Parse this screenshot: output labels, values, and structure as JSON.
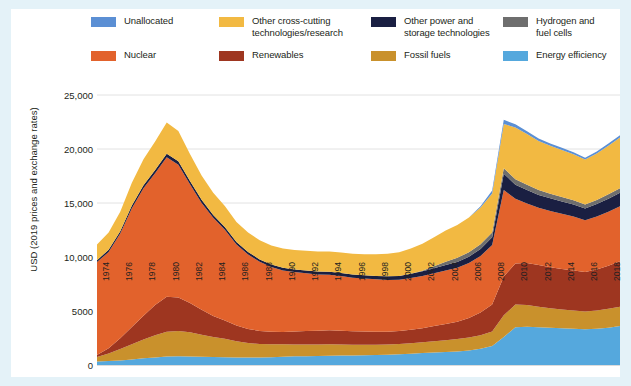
{
  "legend": {
    "items": [
      {
        "label": "Unallocated",
        "color": "#5b8fd4",
        "col": 0,
        "row": 0
      },
      {
        "label": "Other cross-cutting\ntechnologies/research",
        "color": "#f2b942",
        "col": 1,
        "row": 0
      },
      {
        "label": "Other power and\nstorage technologies",
        "color": "#1a1f42",
        "col": 2,
        "row": 0
      },
      {
        "label": "Hydrogen and\nfuel cells",
        "color": "#6e6e6e",
        "col": 3,
        "row": 0
      },
      {
        "label": "Nuclear",
        "color": "#e2622c",
        "col": 0,
        "row": 1
      },
      {
        "label": "Renewables",
        "color": "#9e3620",
        "col": 1,
        "row": 1
      },
      {
        "label": "Fossil fuels",
        "color": "#c9912c",
        "col": 2,
        "row": 1
      },
      {
        "label": "Energy efficiency",
        "color": "#55a8dd",
        "col": 3,
        "row": 1
      }
    ]
  },
  "chart_data": {
    "type": "area",
    "stacked": true,
    "title": "",
    "xlabel": "",
    "ylabel": "USD (2019 prices and exchange rates)",
    "ylim": [
      0,
      25000
    ],
    "yticks": [
      0,
      5000,
      10000,
      15000,
      20000,
      25000
    ],
    "ytick_labels": [
      "0",
      "5000",
      "10,000",
      "15,000",
      "20,000",
      "25,000"
    ],
    "grid": true,
    "legend_position": "top",
    "x": [
      1974,
      1975,
      1976,
      1977,
      1978,
      1979,
      1980,
      1981,
      1982,
      1983,
      1984,
      1985,
      1986,
      1987,
      1988,
      1989,
      1990,
      1991,
      1992,
      1993,
      1994,
      1995,
      1996,
      1997,
      1998,
      1999,
      2000,
      2001,
      2002,
      2003,
      2004,
      2005,
      2006,
      2007,
      2008,
      2009,
      2010,
      2011,
      2012,
      2013,
      2014,
      2015,
      2016,
      2017,
      2018,
      2019
    ],
    "xtick_labels": [
      "1974",
      "1976",
      "1978",
      "1980",
      "1982",
      "1984",
      "1986",
      "1988",
      "1990",
      "1992",
      "1994",
      "1996",
      "1998",
      "2000",
      "2002",
      "2004",
      "2006",
      "2008",
      "2010",
      "2012",
      "2014",
      "2016",
      "2018"
    ],
    "series": [
      {
        "name": "Energy efficiency",
        "color": "#55a8dd",
        "values": [
          330,
          360,
          420,
          520,
          620,
          700,
          780,
          800,
          790,
          760,
          740,
          720,
          700,
          690,
          700,
          720,
          760,
          800,
          820,
          840,
          860,
          870,
          880,
          900,
          920,
          950,
          1000,
          1050,
          1100,
          1150,
          1200,
          1250,
          1350,
          1500,
          1750,
          2600,
          3500,
          3550,
          3500,
          3450,
          3400,
          3350,
          3300,
          3350,
          3450,
          3600
        ]
      },
      {
        "name": "Fossil fuels",
        "color": "#c9912c",
        "values": [
          420,
          700,
          1050,
          1400,
          1750,
          2050,
          2300,
          2350,
          2250,
          2050,
          1850,
          1700,
          1500,
          1350,
          1250,
          1200,
          1150,
          1100,
          1080,
          1060,
          1050,
          1030,
          1000,
          980,
          960,
          950,
          940,
          960,
          1000,
          1050,
          1100,
          1150,
          1200,
          1250,
          1350,
          2000,
          2100,
          2000,
          1900,
          1800,
          1750,
          1700,
          1650,
          1700,
          1750,
          1800
        ]
      },
      {
        "name": "Renewables",
        "color": "#9e3620",
        "values": [
          180,
          500,
          1000,
          1600,
          2200,
          2800,
          3250,
          3100,
          2700,
          2300,
          1950,
          1700,
          1450,
          1300,
          1200,
          1150,
          1150,
          1200,
          1250,
          1280,
          1300,
          1280,
          1250,
          1220,
          1200,
          1180,
          1200,
          1250,
          1300,
          1400,
          1500,
          1600,
          1800,
          2100,
          2500,
          3600,
          3800,
          3900,
          3850,
          3800,
          3750,
          3700,
          3650,
          3800,
          4000,
          4200
        ]
      },
      {
        "name": "Nuclear",
        "color": "#e2622c",
        "values": [
          8600,
          8900,
          9700,
          11000,
          11800,
          12200,
          12900,
          12300,
          11000,
          9900,
          9100,
          8400,
          7500,
          6900,
          6400,
          6000,
          5700,
          5500,
          5350,
          5200,
          5150,
          5050,
          4950,
          4900,
          4850,
          4800,
          4750,
          4800,
          4850,
          4900,
          4950,
          5000,
          5100,
          5250,
          5500,
          8000,
          6000,
          5500,
          5300,
          5200,
          5100,
          5000,
          4800,
          4900,
          5000,
          5100
        ]
      },
      {
        "name": "Other power and storage technologies",
        "color": "#1a1f42",
        "values": [
          180,
          200,
          220,
          250,
          280,
          300,
          320,
          320,
          300,
          280,
          260,
          250,
          240,
          230,
          230,
          230,
          240,
          250,
          260,
          270,
          280,
          290,
          300,
          310,
          320,
          330,
          350,
          380,
          420,
          460,
          500,
          540,
          580,
          640,
          720,
          1500,
          1300,
          1250,
          1200,
          1180,
          1150,
          1120,
          1100,
          1150,
          1200,
          1250
        ]
      },
      {
        "name": "Hydrogen and fuel cells",
        "color": "#6e6e6e",
        "values": [
          0,
          0,
          0,
          0,
          0,
          0,
          0,
          0,
          0,
          0,
          0,
          0,
          0,
          0,
          0,
          0,
          0,
          0,
          0,
          0,
          0,
          0,
          0,
          0,
          0,
          0,
          0,
          0,
          60,
          180,
          300,
          380,
          420,
          440,
          450,
          520,
          500,
          480,
          450,
          430,
          410,
          390,
          370,
          380,
          400,
          410
        ]
      },
      {
        "name": "Other cross-cutting technologies/research",
        "color": "#f2b942",
        "values": [
          1450,
          1600,
          1800,
          2100,
          2400,
          2650,
          2900,
          2800,
          2500,
          2250,
          2050,
          1950,
          1850,
          1800,
          1780,
          1760,
          1780,
          1800,
          1820,
          1850,
          1880,
          1900,
          1920,
          1950,
          2000,
          2080,
          2200,
          2350,
          2500,
          2700,
          2900,
          3050,
          3200,
          3400,
          3600,
          4100,
          4800,
          4700,
          4550,
          4450,
          4350,
          4250,
          4150,
          4300,
          4500,
          4700
        ]
      },
      {
        "name": "Unallocated",
        "color": "#5b8fd4",
        "values": [
          0,
          0,
          0,
          0,
          0,
          0,
          0,
          0,
          0,
          0,
          0,
          0,
          0,
          0,
          0,
          0,
          0,
          0,
          0,
          0,
          0,
          0,
          0,
          0,
          0,
          0,
          0,
          0,
          0,
          0,
          0,
          0,
          0,
          120,
          280,
          380,
          300,
          260,
          230,
          210,
          200,
          190,
          180,
          190,
          200,
          210
        ]
      }
    ]
  }
}
